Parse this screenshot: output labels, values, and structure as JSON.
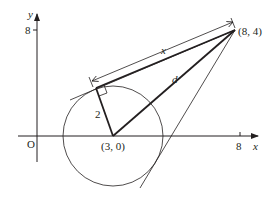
{
  "diagram": {
    "axes": {
      "x_label": "x",
      "y_label": "y",
      "origin_label": "O",
      "x_tick_label": "8",
      "y_tick_label": "8"
    },
    "points": {
      "center_label": "(3, 0)",
      "external_point_label": "(8, 4)"
    },
    "segments": {
      "radius_label": "2",
      "distance_label": "d",
      "tangent_length_label": "x"
    },
    "circle": {
      "center": [
        3,
        0
      ],
      "radius": 2
    },
    "colors": {
      "stroke": "#231f20",
      "background": "#ffffff"
    }
  }
}
